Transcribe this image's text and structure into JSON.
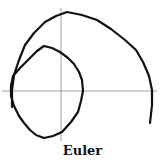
{
  "figure": {
    "caption": "Euler",
    "colors": {
      "trajectory": "#111111",
      "axes": "#8a8a8a",
      "background": "#ffffff"
    }
  },
  "axes": {
    "x_axis": {
      "x1": 2,
      "y1": 91,
      "x2": 157,
      "y2": 91
    },
    "y_axis": {
      "x1": 61,
      "y1": 8,
      "x2": 61,
      "y2": 141
    }
  },
  "trajectory": {
    "method": "Euler",
    "outer_arc_points": [
      [
        12,
        107
      ],
      [
        12,
        90
      ],
      [
        14,
        75
      ],
      [
        19,
        60
      ],
      [
        25,
        45
      ],
      [
        34,
        33
      ],
      [
        45,
        22
      ],
      [
        56,
        16
      ],
      [
        67,
        12
      ],
      [
        82,
        15
      ],
      [
        97,
        20
      ],
      [
        111,
        29
      ],
      [
        125,
        40
      ],
      [
        136,
        50
      ],
      [
        143,
        62
      ],
      [
        149,
        76
      ],
      [
        152,
        90
      ],
      [
        152,
        105
      ],
      [
        150,
        123
      ]
    ],
    "inner_loop_points": [
      [
        13,
        76
      ],
      [
        20,
        68
      ],
      [
        30,
        58
      ],
      [
        37,
        51
      ],
      [
        44,
        46
      ],
      [
        52,
        48
      ],
      [
        60,
        52
      ],
      [
        68,
        58
      ],
      [
        74,
        64
      ],
      [
        79,
        72
      ],
      [
        82,
        80
      ],
      [
        83,
        91
      ],
      [
        81,
        101
      ],
      [
        78,
        112
      ],
      [
        71,
        122
      ],
      [
        62,
        132
      ],
      [
        53,
        136
      ],
      [
        44,
        138
      ],
      [
        36,
        135
      ],
      [
        30,
        130
      ],
      [
        24,
        123
      ],
      [
        19,
        116
      ],
      [
        14,
        106
      ],
      [
        11,
        96
      ],
      [
        11,
        86
      ],
      [
        13,
        76
      ]
    ]
  }
}
